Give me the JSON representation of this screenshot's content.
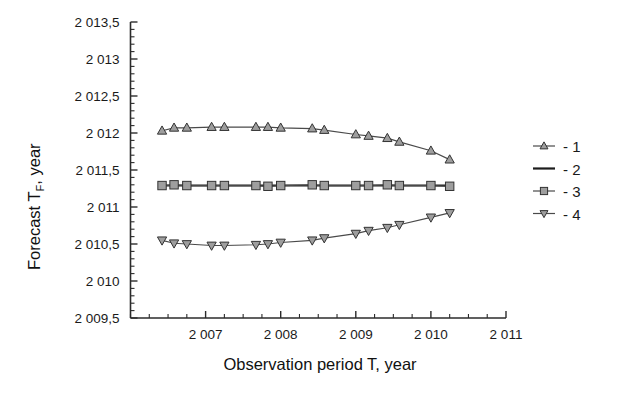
{
  "chart_data": {
    "type": "line",
    "title": "",
    "xlabel": "Observation period T, year",
    "ylabel": "Forecast T",
    "ylabel_sub": "F",
    "ylabel_tail": ", year",
    "xlim": [
      2006.0,
      2011.0
    ],
    "ylim": [
      2009.5,
      2013.5
    ],
    "grid": false,
    "legend_position": "right",
    "xticks": [
      2007,
      2008,
      2009,
      2010,
      2011
    ],
    "xtick_labels": [
      "2 007",
      "2 008",
      "2 009",
      "2 010",
      "2 011"
    ],
    "xtick_minor_step": 0.25,
    "yticks": [
      2009.5,
      2010,
      2010.5,
      2011,
      2011.5,
      2012,
      2012.5,
      2013,
      2013.5
    ],
    "ytick_labels": [
      "2 009,5",
      "2 010",
      "2 010,5",
      "2 011",
      "2 011,5",
      "2 012",
      "2 012,5",
      "2 013",
      "2 013,5"
    ],
    "ytick_minor_step": 0.1,
    "x": [
      2006.42,
      2006.58,
      2006.75,
      2007.08,
      2007.25,
      2007.67,
      2007.83,
      2008.0,
      2008.42,
      2008.58,
      2009.0,
      2009.17,
      2009.42,
      2009.58,
      2010.0,
      2010.25
    ],
    "series": [
      {
        "name": "- 1",
        "marker": "triangle-up",
        "line": true,
        "values": [
          2012.03,
          2012.07,
          2012.07,
          2012.08,
          2012.08,
          2012.08,
          2012.08,
          2012.07,
          2012.06,
          2012.04,
          2011.98,
          2011.96,
          2011.93,
          2011.88,
          2011.76,
          2011.64
        ]
      },
      {
        "name": "- 2",
        "marker": "none",
        "line": true,
        "values": [
          2011.29,
          2011.29,
          2011.29,
          2011.29,
          2011.29,
          2011.29,
          2011.29,
          2011.29,
          2011.29,
          2011.29,
          2011.29,
          2011.29,
          2011.29,
          2011.29,
          2011.29,
          2011.29
        ]
      },
      {
        "name": "- 3",
        "marker": "square",
        "line": true,
        "values": [
          2011.29,
          2011.3,
          2011.29,
          2011.29,
          2011.29,
          2011.29,
          2011.28,
          2011.29,
          2011.3,
          2011.29,
          2011.29,
          2011.29,
          2011.3,
          2011.29,
          2011.29,
          2011.28
        ]
      },
      {
        "name": "- 4",
        "marker": "triangle-down",
        "line": true,
        "values": [
          2010.55,
          2010.51,
          2010.5,
          2010.48,
          2010.48,
          2010.49,
          2010.5,
          2010.52,
          2010.55,
          2010.58,
          2010.64,
          2010.68,
          2010.72,
          2010.76,
          2010.86,
          2010.92
        ]
      }
    ],
    "legend": [
      {
        "label": "- 1",
        "marker": "triangle-up"
      },
      {
        "label": "- 2",
        "marker": "none"
      },
      {
        "label": "- 3",
        "marker": "square"
      },
      {
        "label": "- 4",
        "marker": "triangle-down"
      }
    ],
    "colors": {
      "axis": "#2b2b2b",
      "line": "#4a4a4a",
      "line_bold": "#1c1c1c",
      "marker_fill": "#9e9e9e",
      "marker_stroke": "#333333",
      "text": "#1a1a1a",
      "background": "#ffffff"
    }
  }
}
